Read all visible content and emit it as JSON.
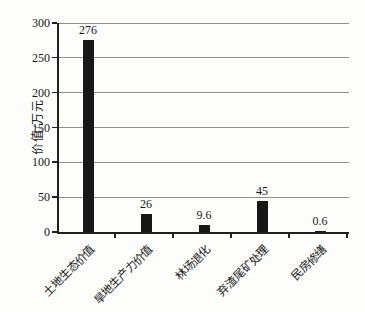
{
  "chart_data": {
    "type": "bar",
    "title": "",
    "categories": [
      "土地生态价值",
      "旱地生产力价值",
      "林场退化",
      "弃渣尾矿处理",
      "民房修缮"
    ],
    "values": [
      276,
      26,
      9.6,
      45,
      0.6
    ],
    "value_labels": [
      "276",
      "26",
      "9.6",
      "45",
      "0.6"
    ],
    "xlabel": "",
    "ylabel": "价值/万元",
    "ylim": [
      0,
      300
    ],
    "yticks": [
      0,
      50,
      100,
      150,
      200,
      250,
      300
    ],
    "grid": "horizontal-on",
    "legend": "none",
    "bar_color": "#171717",
    "gridline_color": "#8f8f8f",
    "axis_color": "#1f1f1f",
    "background_color": "#fdfdfc"
  }
}
